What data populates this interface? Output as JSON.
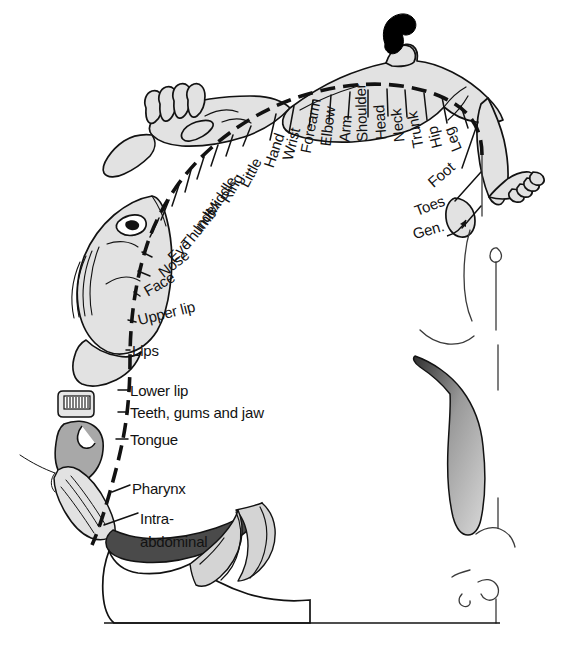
{
  "diagram": {
    "type": "anatomical-cross-section",
    "colors": {
      "ink": "#121212",
      "body_fill": "#e2e2e2",
      "tongue_fill": "#a8a8a8",
      "hair_fill": "#000000",
      "background": "#ffffff",
      "thalamus_dark": "#3a3a3a",
      "thalamus_light": "#d6d6d6"
    },
    "dashed_arc_label": "cortical-representation-arc"
  },
  "labels": [
    {
      "id": "little",
      "text": "Little",
      "x": 243,
      "y": 186,
      "rot": -62
    },
    {
      "id": "ring",
      "text": "Ring",
      "x": 224,
      "y": 201,
      "rot": -60
    },
    {
      "id": "middle",
      "text": "Middle",
      "x": 209,
      "y": 214,
      "rot": -57
    },
    {
      "id": "index",
      "text": "Index",
      "x": 196,
      "y": 230,
      "rot": -54
    },
    {
      "id": "thumb",
      "text": "Thumb",
      "x": 184,
      "y": 246,
      "rot": -51
    },
    {
      "id": "eye",
      "text": "Eye",
      "x": 170,
      "y": 259,
      "rot": -44
    },
    {
      "id": "nose",
      "text": "Nose",
      "x": 160,
      "y": 274,
      "rot": -38
    },
    {
      "id": "face",
      "text": "Face",
      "x": 145,
      "y": 292,
      "rot": -30
    },
    {
      "id": "hand",
      "text": "Hand",
      "x": 268,
      "y": 167,
      "rot": -71
    },
    {
      "id": "wrist",
      "text": "Wrist",
      "x": 287,
      "y": 160,
      "rot": -76
    },
    {
      "id": "forearm",
      "text": "Forearm",
      "x": 305,
      "y": 153,
      "rot": -79
    },
    {
      "id": "elbow",
      "text": "Elbow",
      "x": 325,
      "y": 146,
      "rot": -83
    },
    {
      "id": "arm",
      "text": "Arm",
      "x": 344,
      "y": 142,
      "rot": -85
    },
    {
      "id": "shoulder",
      "text": "Shoulder",
      "x": 362,
      "y": 142,
      "rot": -92
    },
    {
      "id": "head",
      "text": "Head",
      "x": 381,
      "y": 140,
      "rot": -94
    },
    {
      "id": "neck",
      "text": "Neck",
      "x": 399,
      "y": 142,
      "rot": -96
    },
    {
      "id": "trunk",
      "text": "Trunk",
      "x": 418,
      "y": 148,
      "rot": -100
    },
    {
      "id": "hip",
      "text": "Hip",
      "x": 437,
      "y": 148,
      "rot": -104
    },
    {
      "id": "leg",
      "text": "Leg",
      "x": 457,
      "y": 151,
      "rot": -112
    },
    {
      "id": "foot",
      "text": "Foot",
      "x": 430,
      "y": 184,
      "rot": -41
    },
    {
      "id": "toes",
      "text": "Toes",
      "x": 415,
      "y": 211,
      "rot": -21
    },
    {
      "id": "gen",
      "text": "Gen.",
      "x": 413,
      "y": 234,
      "rot": -16
    },
    {
      "id": "upper-lip",
      "text": "Upper lip",
      "x": 138,
      "y": 320,
      "rot": -14
    },
    {
      "id": "lips",
      "text": "Lips",
      "x": 132,
      "y": 350,
      "rot": 0
    },
    {
      "id": "lower-lip",
      "text": "Lower lip",
      "x": 130,
      "y": 390,
      "rot": 0
    },
    {
      "id": "teeth",
      "text": "Teeth, gums and jaw",
      "x": 130,
      "y": 412,
      "rot": 0
    },
    {
      "id": "tongue",
      "text": "Tongue",
      "x": 130,
      "y": 439,
      "rot": 0
    },
    {
      "id": "pharynx",
      "text": "Pharynx",
      "x": 132,
      "y": 488,
      "rot": 0
    },
    {
      "id": "intra",
      "text": "Intra-",
      "x": 140,
      "y": 518,
      "rot": 0
    },
    {
      "id": "abdominal",
      "text": "abdominal",
      "x": 140,
      "y": 541,
      "rot": 0
    }
  ]
}
